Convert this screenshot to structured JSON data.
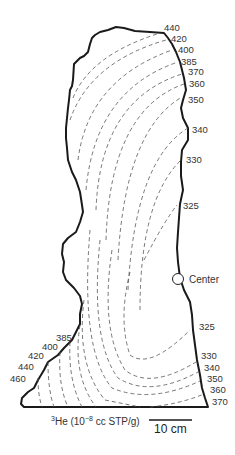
{
  "diagram": {
    "type": "contour-map",
    "title": "",
    "quantity": "3He concentration",
    "caption": {
      "isotope_sup": "3",
      "isotope": "He (10",
      "exp_sup": "−8",
      "units": " cc STP/g)"
    },
    "scale_bar": {
      "label": "10 cm"
    },
    "center_label": "Center",
    "right_labels": [
      "440",
      "420",
      "400",
      "385",
      "370",
      "360",
      "350",
      "340",
      "330",
      "325",
      "325",
      "330",
      "340",
      "350",
      "360",
      "370"
    ],
    "left_labels": [
      "385",
      "400",
      "420",
      "440",
      "460"
    ],
    "contour_values": [
      325,
      330,
      340,
      350,
      360,
      370,
      385,
      400,
      420,
      440,
      460
    ],
    "colors": {
      "outline": "#1a1a1a",
      "contour": "#555555",
      "background": "#ffffff"
    }
  }
}
